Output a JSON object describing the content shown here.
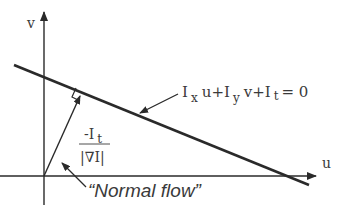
{
  "axes": {
    "v_label": "v",
    "u_label": "u"
  },
  "equation": {
    "I1": "I",
    "sub_x": "x",
    "term1": "u+I",
    "sub_y": "y",
    "term2": "v+I",
    "sub_t": "t",
    "rhs": "= 0"
  },
  "fraction": {
    "numerator_prefix": "-I",
    "numerator_sub": "t",
    "denominator": "|∇I|"
  },
  "annotation": {
    "normal_flow": "“Normal flow”"
  },
  "colors": {
    "line": "#2a2a2a",
    "text": "#3a3a3a",
    "background": "#ffffff"
  }
}
